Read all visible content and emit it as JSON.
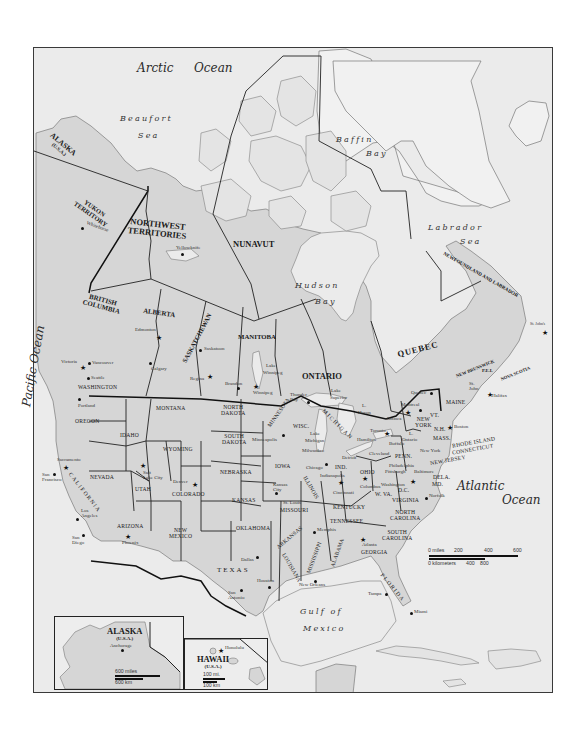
{
  "map": {
    "title": "North America political map",
    "colors": {
      "land": "#d6d6d6",
      "water": "#ebebeb",
      "greenland": "#f2f2f2",
      "border": "#222222",
      "coast": "#777777",
      "frame": "#3a3a3a"
    }
  },
  "water_bodies": {
    "arctic_ocean_1": "Arctic",
    "arctic_ocean_2": "Ocean",
    "beaufort_1": "Beaufort",
    "beaufort_2": "Sea",
    "baffin_1": "Baffin",
    "baffin_2": "Bay",
    "labrador_1": "Labrador",
    "labrador_2": "Sea",
    "hudson_1": "Hudson",
    "hudson_2": "Bay",
    "pacific": "Pacific   Ocean",
    "atlantic_1": "Atlantic",
    "atlantic_2": "Ocean",
    "gulf_1": "Gulf of",
    "gulf_2": "Mexico",
    "lake_superior_1": "Lake",
    "lake_superior_2": "Superior",
    "lake_huron_1": "L.",
    "lake_huron_2": "Huron",
    "lake_michigan_1": "Lake",
    "lake_michigan_2": "Michigan",
    "lake_ontario_1": "L.",
    "lake_ontario_2": "Ontario",
    "lake_winnipeg_1": "Lake",
    "lake_winnipeg_2": "Winnipeg"
  },
  "provinces": {
    "alaska": "ALASKA",
    "alaska_sub": "(U.S.A.)",
    "yukon_1": "YUKON",
    "yukon_2": "TERRITORY",
    "nwt_1": "NORTHWEST",
    "nwt_2": "TERRITORIES",
    "nunavut": "NUNAVUT",
    "bc_1": "BRITISH",
    "bc_2": "COLUMBIA",
    "alberta": "ALBERTA",
    "saskatchewan": "SASKATCHEWAN",
    "manitoba": "MANITOBA",
    "ontario": "ONTARIO",
    "quebec": "QUEBEC",
    "newfoundland": "NEWFOUNDLAND AND LABRADOR",
    "new_brunswick": "NEW BRUNSWICK",
    "pei": "P.E.I.",
    "nova_scotia": "NOVA SCOTIA"
  },
  "states": {
    "washington": "WASHINGTON",
    "oregon": "OREGON",
    "idaho": "IDAHO",
    "montana": "MONTANA",
    "wyoming": "WYOMING",
    "north_dakota_1": "NORTH",
    "north_dakota_2": "DAKOTA",
    "south_dakota_1": "SOUTH",
    "south_dakota_2": "DAKOTA",
    "minnesota": "MINNESOTA",
    "wisconsin": "WISC.",
    "michigan": "MICHIGAN",
    "nevada": "NEVADA",
    "california": "CALIFORNIA",
    "utah": "UTAH",
    "colorado": "COLORADO",
    "nebraska": "NEBRASKA",
    "iowa": "IOWA",
    "kansas": "KANSAS",
    "missouri": "MISSOURI",
    "illinois": "ILLINOIS",
    "indiana": "IND.",
    "ohio": "OHIO",
    "kentucky": "KENTUCKY",
    "arizona": "ARIZONA",
    "new_mexico_1": "NEW",
    "new_mexico_2": "MEXICO",
    "oklahoma": "OKLAHOMA",
    "texas": "TEXAS",
    "arkansas": "ARKANSAS",
    "louisiana": "LOUISIANA",
    "mississippi": "MISSISSIPPI",
    "alabama": "ALABAMA",
    "tennessee": "TENNESSEE",
    "georgia": "GEORGIA",
    "florida": "FLORIDA",
    "south_carolina_1": "SOUTH",
    "south_carolina_2": "CAROLINA",
    "north_carolina_1": "NORTH",
    "north_carolina_2": "CAROLINA",
    "virginia": "VIRGINIA",
    "west_virginia": "W. VA.",
    "penn": "PENN.",
    "new_york_1": "NEW",
    "new_york_2": "YORK",
    "vermont": "VT.",
    "new_hampshire": "N.H.",
    "maine": "MAINE",
    "mass": "MASS.",
    "rhode_island": "RHODE ISLAND",
    "connecticut": "CONNECTICUT",
    "new_jersey": "NEW JERSEY",
    "delaware": "DELA.",
    "maryland": "MD.",
    "dc": "D.C."
  },
  "cities": {
    "whitehorse": "Whitehorse",
    "yellowknife": "Yellowknife",
    "edmonton": "Edmonton",
    "calgary": "Calgary",
    "saskatoon": "Saskatoon",
    "regina": "Regina",
    "brandon": "Brandon",
    "winnipeg": "Winnipeg",
    "victoria": "Victoria",
    "vancouver": "Vancouver",
    "seattle": "Seattle",
    "portland": "Portland",
    "thunder_bay_1": "Thunder",
    "thunder_bay_2": "Bay",
    "quebec_city": "Quebec",
    "montreal": "Montreal",
    "ottawa": "Ottawa",
    "toronto": "Toronto",
    "hamilton": "Hamilton",
    "buffalo": "Buffalo",
    "st_john_1": "St.",
    "st_john_2": "John",
    "halifax": "Halifax",
    "st_johns": "St. John's",
    "boston": "Boston",
    "new_york_city_1": "New",
    "new_york_city_2": "York",
    "minneapolis": "Minneapolis",
    "milwaukee": "Milwaukee",
    "chicago": "Chicago",
    "detroit": "Detroit",
    "cleveland": "Cleveland",
    "indianapolis": "Indianapolis",
    "columbus": "Columbus",
    "cincinnati": "Cincinnati",
    "philadelphia": "Philadelphia",
    "pittsburgh": "Pittsburgh",
    "baltimore": "Baltimore",
    "washington_dc": "Washington",
    "norfolk": "Norfolk",
    "sacramento": "Sacramento",
    "san_francisco_1": "San",
    "san_francisco_2": "Francisco",
    "los_angeles_1": "Los",
    "los_angeles_2": "Angeles",
    "san_diego_1": "San",
    "san_diego_2": "Diego",
    "salt_lake_1": "Salt",
    "salt_lake_2": "Lake City",
    "denver": "Denver",
    "phoenix": "Phoenix",
    "kansas_city_1": "Kansas",
    "kansas_city_2": "City",
    "st_louis": "St. Louis",
    "dallas": "Dallas",
    "houston": "Houston",
    "san_antonio_1": "San",
    "san_antonio_2": "Antonio",
    "memphis": "Memphis",
    "new_orleans_1": "New",
    "new_orleans_2": "Orleans",
    "atlanta": "Atlanta",
    "tampa": "Tampa",
    "miami": "Miami",
    "anchorage": "Anchorage",
    "honolulu": "Honolulu"
  },
  "scale_bar": {
    "miles_label": "0 miles",
    "miles_ticks": [
      "200",
      "400",
      "600"
    ],
    "km_label": "0 kilometers",
    "km_ticks": [
      "400",
      "800"
    ]
  },
  "insets": {
    "alaska": {
      "title": "ALASKA",
      "sub": "(U.S.A.)",
      "city": "Anchorage",
      "scale_miles": "600 miles",
      "scale_km": "600 km"
    },
    "hawaii": {
      "title": "HAWAII",
      "sub": "(U.S.A.)",
      "city": "Honolulu",
      "scale_miles": "100 mi.",
      "scale_km": "100 km"
    }
  }
}
